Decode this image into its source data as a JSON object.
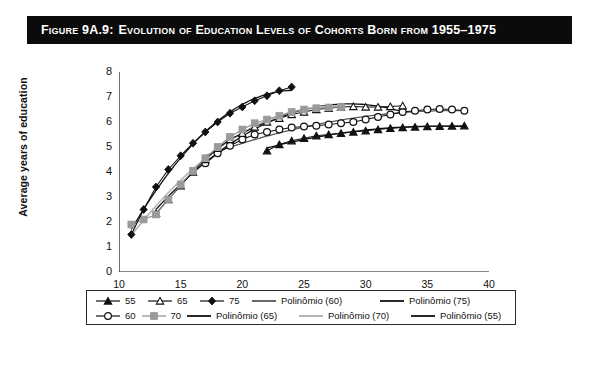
{
  "figure": {
    "label": "Figure 9A.9:",
    "caption": "Evolution of Education Levels of Cohorts Born from 1955–1975",
    "title_full": "Figure 9A.9: Evolution of Education Levels of Cohorts Born from 1955–1975"
  },
  "colors": {
    "title_bar_bg": "#0b0b0b",
    "title_text": "#ffffff",
    "axis": "#111111",
    "series_dark": "#111111",
    "series_gray": "#9a9a9a",
    "series_midgray": "#6f6f6f",
    "panel_bg": "#ffffff",
    "frame": "#1a1a1a"
  },
  "chart_data": {
    "type": "line",
    "title": "Evolution of Education Levels of Cohorts Born from 1955–1975",
    "xlabel": "Age",
    "ylabel": "Average years of education",
    "xlim": [
      10,
      40
    ],
    "ylim": [
      0,
      8
    ],
    "xticks": [
      10,
      15,
      20,
      25,
      30,
      35,
      40
    ],
    "yticks": [
      0,
      1,
      2,
      3,
      4,
      5,
      6,
      7,
      8
    ],
    "grid": false,
    "legend_position": "bottom",
    "series": [
      {
        "name": "55",
        "marker": "filled-triangle",
        "color": "#111111",
        "x": [
          22,
          23,
          24,
          25,
          26,
          27,
          28,
          29,
          30,
          31,
          32,
          33,
          34,
          35,
          36,
          37,
          38
        ],
        "y": [
          4.85,
          5.1,
          5.25,
          5.35,
          5.45,
          5.5,
          5.55,
          5.6,
          5.65,
          5.7,
          5.75,
          5.78,
          5.8,
          5.82,
          5.83,
          5.84,
          5.85
        ]
      },
      {
        "name": "60",
        "marker": "open-circle",
        "color": "#111111",
        "x": [
          17,
          18,
          19,
          20,
          21,
          22,
          23,
          24,
          25,
          26,
          27,
          28,
          29,
          30,
          31,
          32,
          33,
          34,
          35,
          36,
          37,
          38
        ],
        "y": [
          4.35,
          4.75,
          5.05,
          5.3,
          5.5,
          5.6,
          5.7,
          5.78,
          5.82,
          5.85,
          5.9,
          5.95,
          6.0,
          6.1,
          6.2,
          6.3,
          6.4,
          6.45,
          6.5,
          6.52,
          6.5,
          6.45
        ]
      },
      {
        "name": "65",
        "marker": "open-triangle",
        "color": "#111111",
        "x": [
          13,
          14,
          15,
          16,
          17,
          18,
          19,
          20,
          21,
          22,
          23,
          24,
          25,
          26,
          27,
          28,
          29,
          30,
          31,
          32,
          33
        ],
        "y": [
          2.35,
          2.9,
          3.45,
          4.0,
          4.5,
          4.95,
          5.3,
          5.55,
          5.8,
          6.0,
          6.15,
          6.3,
          6.4,
          6.5,
          6.55,
          6.6,
          6.62,
          6.6,
          6.6,
          6.62,
          6.65
        ]
      },
      {
        "name": "70",
        "marker": "filled-square",
        "color": "#9a9a9a",
        "x": [
          11,
          12,
          13,
          14,
          15,
          16,
          17,
          18,
          19,
          20,
          21,
          22,
          23,
          24,
          25,
          26,
          27,
          28
        ],
        "y": [
          1.9,
          2.1,
          2.3,
          2.9,
          3.5,
          4.05,
          4.55,
          5.0,
          5.4,
          5.7,
          5.95,
          6.1,
          6.25,
          6.4,
          6.5,
          6.55,
          6.58,
          6.6
        ]
      },
      {
        "name": "75",
        "marker": "filled-diamond",
        "color": "#111111",
        "x": [
          11,
          12,
          13,
          14,
          15,
          16,
          17,
          18,
          19,
          20,
          21,
          22,
          23,
          24
        ],
        "y": [
          1.5,
          2.5,
          3.4,
          4.1,
          4.65,
          5.15,
          5.6,
          6.0,
          6.35,
          6.6,
          6.85,
          7.05,
          7.25,
          7.4
        ]
      }
    ],
    "trendlines": [
      {
        "name": "Polinômio (55)",
        "color": "#111111"
      },
      {
        "name": "Polinômio (60)",
        "color": "#5a5a5a"
      },
      {
        "name": "Polinômio (65)",
        "color": "#111111"
      },
      {
        "name": "Polinômio (70)",
        "color": "#b5b5b5"
      },
      {
        "name": "Polinômio (75)",
        "color": "#111111"
      }
    ],
    "annotations": []
  },
  "legend": {
    "rows": [
      [
        {
          "label": "55",
          "marker": "filled-triangle",
          "color": "#111111",
          "kind": "series"
        },
        {
          "label": "65",
          "marker": "open-triangle",
          "color": "#111111",
          "kind": "series"
        },
        {
          "label": "75",
          "marker": "filled-diamond",
          "color": "#111111",
          "kind": "series"
        },
        {
          "label": "Polinômio (60)",
          "marker": "line",
          "color": "#5a5a5a",
          "kind": "trend"
        },
        {
          "label": "Polinômio (75)",
          "marker": "line",
          "color": "#111111",
          "kind": "trend"
        }
      ],
      [
        {
          "label": "60",
          "marker": "open-circle",
          "color": "#111111",
          "kind": "series"
        },
        {
          "label": "70",
          "marker": "filled-square",
          "color": "#9a9a9a",
          "kind": "series"
        },
        {
          "label": "Polinômio (65)",
          "marker": "line",
          "color": "#111111",
          "kind": "trend"
        },
        {
          "label": "Polinômio (70)",
          "marker": "line",
          "color": "#b5b5b5",
          "kind": "trend"
        },
        {
          "label": "Polinômio (55)",
          "marker": "line",
          "color": "#111111",
          "kind": "trend"
        }
      ]
    ]
  }
}
